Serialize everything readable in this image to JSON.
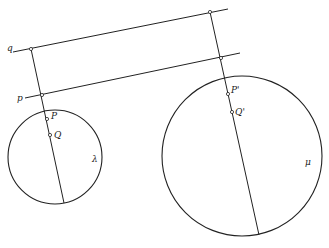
{
  "diagram": {
    "type": "geometric-construction",
    "labels": {
      "line_q": "q",
      "line_p": "p",
      "point_p": "P",
      "point_q": "Q",
      "circle_left": "λ",
      "point_p_prime": "P'",
      "point_q_prime": "Q'",
      "circle_right": "μ"
    },
    "lines": [
      {
        "name": "line-q",
        "x1": 13,
        "y1": 52,
        "x2": 228,
        "y2": 9
      },
      {
        "name": "line-p",
        "x1": 25,
        "y1": 98,
        "x2": 240,
        "y2": 53
      },
      {
        "name": "transversal-left",
        "x1": 31,
        "y1": 49,
        "x2": 64,
        "y2": 203
      },
      {
        "name": "transversal-right",
        "x1": 210,
        "y1": 12,
        "x2": 259,
        "y2": 235
      }
    ],
    "circles": [
      {
        "name": "circle-lambda",
        "cx": 55,
        "cy": 157,
        "r": 47
      },
      {
        "name": "circle-mu",
        "cx": 242,
        "cy": 156,
        "r": 80
      }
    ],
    "points": [
      {
        "name": "q-intersection-left",
        "x": 31,
        "y": 49
      },
      {
        "name": "p-intersection-left",
        "x": 42,
        "y": 95
      },
      {
        "name": "point-P",
        "x": 47,
        "y": 119
      },
      {
        "name": "point-Q",
        "x": 50,
        "y": 135
      },
      {
        "name": "q-intersection-right",
        "x": 210,
        "y": 12
      },
      {
        "name": "p-intersection-right",
        "x": 221,
        "y": 58
      },
      {
        "name": "point-P-prime",
        "x": 228,
        "y": 94
      },
      {
        "name": "point-Q-prime",
        "x": 232,
        "y": 112
      }
    ]
  }
}
